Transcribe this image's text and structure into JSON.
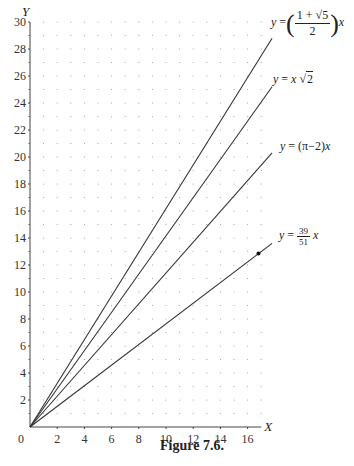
{
  "chart_data": {
    "type": "line",
    "title": "Figure 7.6.",
    "xlabel": "X",
    "ylabel": "Y",
    "xlim": [
      0,
      17.8
    ],
    "ylim": [
      0,
      30
    ],
    "x_ticks": [
      0,
      2,
      4,
      6,
      8,
      10,
      12,
      14,
      16
    ],
    "y_ticks": [
      2,
      4,
      6,
      8,
      10,
      12,
      14,
      16,
      18,
      20,
      22,
      24,
      26,
      28,
      30
    ],
    "grid": "dotted (points at every integer x, y)",
    "series": [
      {
        "name": "y = ((1+√5)/2) x",
        "slope": 1.618,
        "x": [
          0,
          17.8
        ],
        "y": [
          0,
          28.8
        ]
      },
      {
        "name": "y = x√2",
        "slope": 1.414,
        "x": [
          0,
          17.8
        ],
        "y": [
          0,
          25.2
        ]
      },
      {
        "name": "y = (π−2)x",
        "slope": 1.1416,
        "x": [
          0,
          17.8
        ],
        "y": [
          0,
          20.3
        ]
      },
      {
        "name": "y = (39/51) x",
        "slope": 0.7647,
        "x": [
          0,
          17.8
        ],
        "y": [
          0,
          13.6
        ],
        "marked_point": [
          16.8,
          12.85
        ]
      }
    ]
  },
  "axes": {
    "x_label": "X",
    "y_label": "Y",
    "origin_label": "0"
  },
  "labels": {
    "golden": {
      "lhs": "y",
      "eq": "=",
      "num": "1 + √5",
      "den": "2",
      "rhs": "x"
    },
    "sqrt2": {
      "lhs": "y",
      "eq": "=",
      "x": "x",
      "root": "√",
      "radicand": "2"
    },
    "pi": {
      "text_pre": "y",
      "text_post": " = (π−2)",
      "x": "x"
    },
    "ratio": {
      "lhs": "y",
      "eq": "=",
      "num": "39",
      "den": "51",
      "rhs": "x"
    }
  },
  "caption": "Figure 7.6."
}
